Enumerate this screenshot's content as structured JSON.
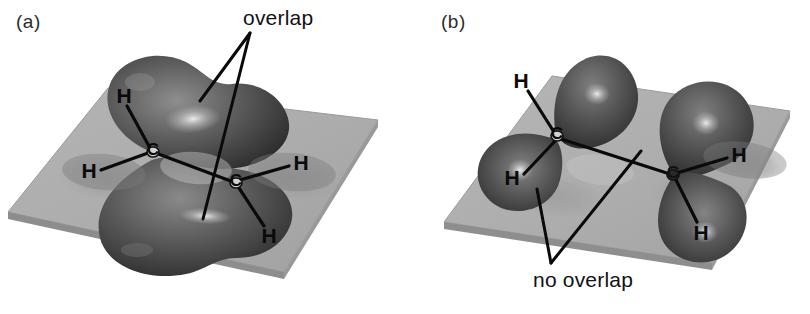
{
  "figure": {
    "kind": "orbital-overlap-diagram",
    "background_color": "#ffffff",
    "plane_color": "#ababab",
    "plane_edge_color": "#8d8d8d",
    "lobe_color": "#4f4f4f",
    "lobe_dark_color": "#2e2e2e",
    "lobe_highlight_color": "#d8d8d8",
    "shadow_color": "#979797",
    "line_color": "#0a0a0a"
  },
  "panels": [
    {
      "id": "a",
      "label": "(a)",
      "label_pos": {
        "x": 16,
        "y": 11
      },
      "description": "planar ethene, p orbitals parallel and overlapping to form a pi bond",
      "callouts": [
        {
          "name": "overlap",
          "text": "overlap",
          "text_pos": {
            "x": 243,
            "y": 6
          },
          "apex": {
            "x": 250,
            "y": 33
          },
          "targets": [
            {
              "x": 200,
              "y": 101
            },
            {
              "x": 203,
              "y": 219
            }
          ]
        }
      ],
      "atoms": [
        {
          "symbol": "C",
          "name": "carbon-left",
          "x": 153,
          "y": 152,
          "size": "small"
        },
        {
          "symbol": "C",
          "name": "carbon-right",
          "x": 236,
          "y": 183,
          "size": "small"
        },
        {
          "symbol": "H",
          "name": "hydrogen-upper-left",
          "x": 124,
          "y": 96
        },
        {
          "symbol": "H",
          "name": "hydrogen-left",
          "x": 89,
          "y": 171
        },
        {
          "symbol": "H",
          "name": "hydrogen-right",
          "x": 301,
          "y": 163
        },
        {
          "symbol": "H",
          "name": "hydrogen-lower-right",
          "x": 269,
          "y": 236
        }
      ],
      "bonds": [
        {
          "name": "bond-c-c",
          "x1": 153,
          "y1": 152,
          "x2": 236,
          "y2": 183
        },
        {
          "name": "bond-c-left-h-upper",
          "x1": 150,
          "y1": 148,
          "x2": 127,
          "y2": 106
        },
        {
          "name": "bond-c-left-h-left",
          "x1": 148,
          "y1": 153,
          "x2": 101,
          "y2": 170
        },
        {
          "name": "bond-c-right-h-right",
          "x1": 240,
          "y1": 180,
          "x2": 289,
          "y2": 166
        },
        {
          "name": "bond-c-right-h-lower",
          "x1": 239,
          "y1": 188,
          "x2": 264,
          "y2": 226
        }
      ]
    },
    {
      "id": "b",
      "label": "(b)",
      "label_pos": {
        "x": 441,
        "y": 11
      },
      "description": "twisted ethene, p orbitals perpendicular so no pi overlap is possible",
      "callouts": [
        {
          "name": "no-overlap",
          "text": "no overlap",
          "text_pos": {
            "x": 533,
            "y": 268
          },
          "apex": {
            "x": 551,
            "y": 263
          },
          "targets": [
            {
              "x": 537,
              "y": 189
            },
            {
              "x": 641,
              "y": 151
            }
          ]
        }
      ],
      "atoms": [
        {
          "symbol": "C",
          "name": "carbon-left",
          "x": 557,
          "y": 136,
          "size": "small"
        },
        {
          "symbol": "C",
          "name": "carbon-right",
          "x": 673,
          "y": 175,
          "size": "small"
        },
        {
          "symbol": "H",
          "name": "hydrogen-upper-left",
          "x": 521,
          "y": 81
        },
        {
          "symbol": "H",
          "name": "hydrogen-lower-left",
          "x": 512,
          "y": 178
        },
        {
          "symbol": "H",
          "name": "hydrogen-right",
          "x": 739,
          "y": 155
        },
        {
          "symbol": "H",
          "name": "hydrogen-lower-right",
          "x": 701,
          "y": 233
        }
      ],
      "bonds": [
        {
          "name": "bond-c-c",
          "x1": 558,
          "y1": 138,
          "x2": 673,
          "y2": 175
        },
        {
          "name": "bond-c-left-h-upper",
          "x1": 554,
          "y1": 132,
          "x2": 528,
          "y2": 91
        },
        {
          "name": "bond-c-left-h-lower",
          "x1": 556,
          "y1": 140,
          "x2": 524,
          "y2": 174
        },
        {
          "name": "bond-c-right-h-right",
          "x1": 677,
          "y1": 173,
          "x2": 727,
          "y2": 158
        },
        {
          "name": "bond-c-right-h-lower",
          "x1": 676,
          "y1": 180,
          "x2": 697,
          "y2": 222
        }
      ]
    }
  ]
}
